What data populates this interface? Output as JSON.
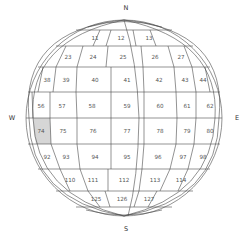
{
  "diagram": {
    "type": "sphere-grid",
    "highlight_color": "#d6d6d6",
    "line_color": "#4a4a4a",
    "compass": {
      "north": "N",
      "south": "S",
      "west": "W",
      "east": "E"
    },
    "highlighted_cell": "74",
    "rows": [
      {
        "row": 1,
        "cells": [
          "11",
          "12",
          "13"
        ]
      },
      {
        "row": 2,
        "cells": [
          "23",
          "24",
          "25",
          "26",
          "27"
        ]
      },
      {
        "row": 3,
        "cells": [
          "38",
          "39",
          "40",
          "41",
          "42",
          "43",
          "44"
        ]
      },
      {
        "row": 4,
        "cells": [
          "56",
          "57",
          "58",
          "59",
          "60",
          "61",
          "62"
        ]
      },
      {
        "row": 5,
        "cells": [
          "74",
          "75",
          "76",
          "77",
          "78",
          "79",
          "80"
        ]
      },
      {
        "row": 6,
        "cells": [
          "92",
          "93",
          "94",
          "95",
          "96",
          "97",
          "98"
        ]
      },
      {
        "row": 7,
        "cells": [
          "110",
          "111",
          "112",
          "113",
          "114"
        ]
      },
      {
        "row": 8,
        "cells": [
          "125",
          "126",
          "127"
        ]
      }
    ]
  }
}
